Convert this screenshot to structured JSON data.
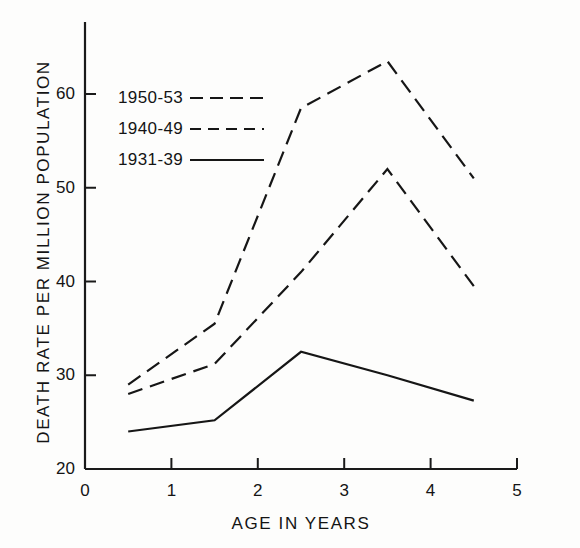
{
  "chart_data": {
    "type": "line",
    "title": "",
    "xlabel": "AGE IN YEARS",
    "ylabel": "DEATH RATE PER MILLION POPULATION",
    "x": [
      0.5,
      1.5,
      2.5,
      3.5,
      4.5
    ],
    "xlim": [
      0,
      5
    ],
    "ylim": [
      20,
      65
    ],
    "xticks": [
      "0",
      "1",
      "2",
      "3",
      "4",
      "5"
    ],
    "yticks": [
      "20",
      "30",
      "40",
      "50",
      "60"
    ],
    "grid": false,
    "legend_position": "upper-left-inside",
    "series": [
      {
        "name": "1950-53",
        "style": "dashed",
        "values": [
          29.0,
          35.5,
          58.5,
          63.5,
          51.0
        ]
      },
      {
        "name": "1940-49",
        "style": "dashed",
        "values": [
          28.0,
          31.2,
          41.0,
          52.0,
          39.5
        ]
      },
      {
        "name": "1931-39",
        "style": "solid",
        "values": [
          24.0,
          25.2,
          32.5,
          30.0,
          27.3
        ]
      }
    ],
    "colors": {
      "line": "#161616",
      "axis": "#1a1a1a",
      "background": "#fdfdfc"
    }
  },
  "legend": {
    "entries": [
      {
        "label": "1950-53",
        "style": "dashed-long"
      },
      {
        "label": "1940-49",
        "style": "dashed-short"
      },
      {
        "label": "1931-39",
        "style": "solid"
      }
    ]
  }
}
